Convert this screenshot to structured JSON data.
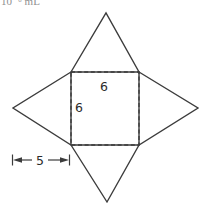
{
  "page": {
    "background": "#ffffff",
    "line_color": "#3c3c3c",
    "label_color": "#2b2b2b",
    "corner_text_color": "#8f8f8f"
  },
  "corner": {
    "clipped_text": "10⁻⁶ mL"
  },
  "figure": {
    "labels": {
      "square_top_side": "6",
      "square_left_side": "6",
      "triangle_height": "5"
    }
  }
}
